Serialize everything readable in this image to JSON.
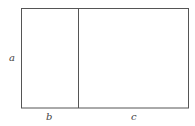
{
  "diagram": {
    "labels": {
      "a": "a",
      "b": "b",
      "c": "c"
    },
    "line_color": "#555555"
  }
}
